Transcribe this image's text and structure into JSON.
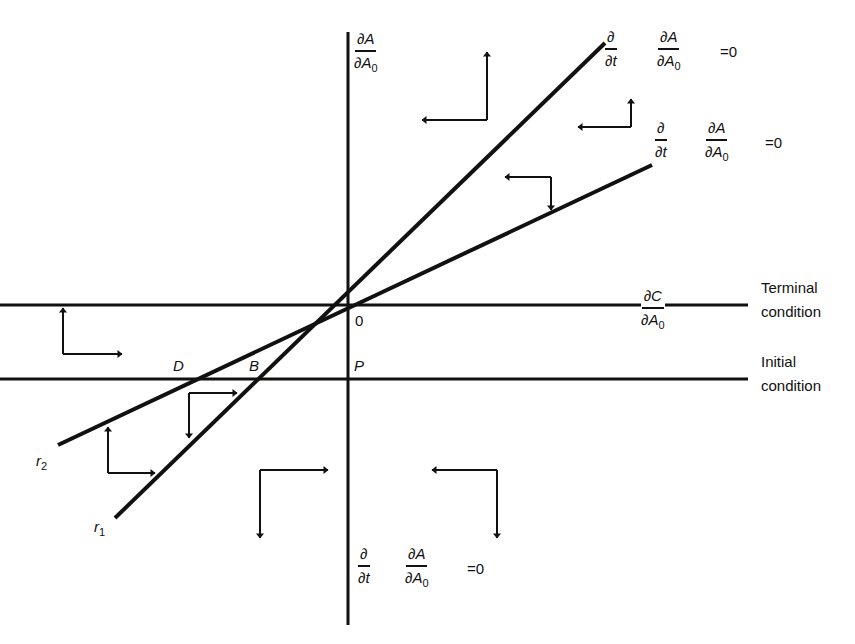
{
  "diagram": {
    "type": "phase-diagram",
    "colors": {
      "line": "#111111",
      "background": "#ffffff"
    },
    "axes": {
      "vertical": {
        "label_num": "∂A",
        "label_den": "∂A",
        "label_den_sub": "0"
      },
      "horizontal_terminal": {
        "label_num": "∂C",
        "label_den": "∂A",
        "label_den_sub": "0"
      }
    },
    "origin_label": "0",
    "points": {
      "D": "D",
      "B": "B",
      "P": "P"
    },
    "rays": {
      "r2": {
        "letter": "r",
        "sub": "2"
      },
      "r1": {
        "letter": "r",
        "sub": "1"
      }
    },
    "conditions": {
      "terminal": [
        "Terminal",
        "condition"
      ],
      "initial": [
        "Initial",
        "condition"
      ]
    },
    "isoclines": [
      {
        "id": "steep-top",
        "d_num": "∂",
        "d_den": "∂t",
        "f_num": "∂A",
        "f_den": "∂A",
        "f_sub": "0",
        "eq": "=0"
      },
      {
        "id": "shallow-top",
        "d_num": "∂",
        "d_den": "∂t",
        "f_num": "∂A",
        "f_den": "∂A",
        "f_sub": "0",
        "eq": "=0"
      },
      {
        "id": "vertical-bottom",
        "d_num": "∂",
        "d_den": "∂t",
        "f_num": "∂A",
        "f_den": "∂A",
        "f_sub": "0",
        "eq": "=0"
      }
    ],
    "direction_arrows": [
      {
        "region": "top-middle",
        "directions": [
          "left",
          "up"
        ]
      },
      {
        "region": "top-right",
        "directions": [
          "left",
          "up"
        ]
      },
      {
        "region": "between-rays-upper",
        "directions": [
          "left",
          "down"
        ]
      },
      {
        "region": "left-between-conditions",
        "directions": [
          "up",
          "right"
        ]
      },
      {
        "region": "between-rays-lower",
        "directions": [
          "right",
          "down"
        ]
      },
      {
        "region": "left-bottom",
        "directions": [
          "up",
          "right"
        ]
      },
      {
        "region": "bottom-middle-left",
        "directions": [
          "right",
          "down"
        ]
      },
      {
        "region": "bottom-right",
        "directions": [
          "left",
          "down"
        ]
      }
    ]
  }
}
